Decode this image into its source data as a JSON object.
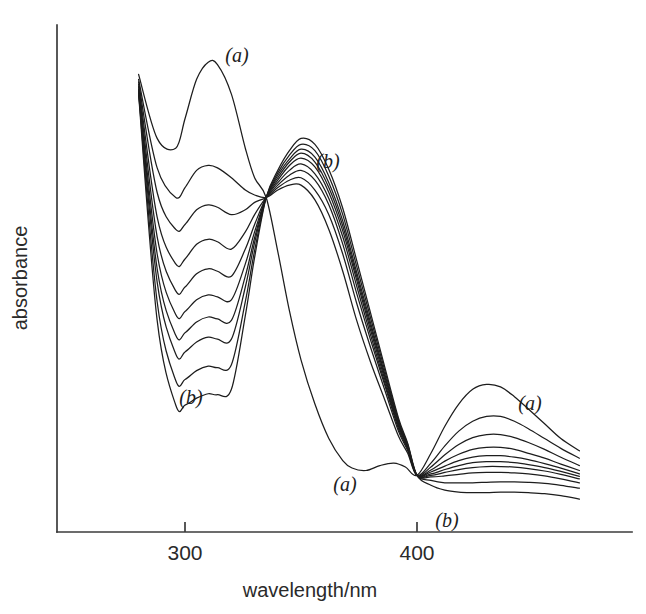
{
  "figure": {
    "kind": "uv-vis-absorption-spectra",
    "background_color": "#ffffff",
    "line_color": "#1d1d1d",
    "axis_color": "#3b3b3b"
  },
  "axes": {
    "x_title": "wavelength/nm",
    "y_title": "absorbance",
    "x_ticks": [
      {
        "label": "300",
        "value": 300
      },
      {
        "label": "400",
        "value": 400
      }
    ],
    "y_ticks": []
  },
  "labels": {
    "top_left_a": "(a)",
    "top_mid_b": "(b)",
    "lower_left_b": "(b)",
    "lower_mid_a": "(a)",
    "right_a": "(a)",
    "right_b": "(b)"
  },
  "chart_data": {
    "type": "line",
    "title": "",
    "xlabel": "wavelength/nm",
    "ylabel": "absorbance",
    "xlim": [
      270,
      472
    ],
    "ylim": [
      0,
      1.0
    ],
    "grid": false,
    "legend": "none",
    "n_series": 10,
    "series_direction": "(a) to (b) — decreasing UV band at 310 nm and visible band at 430 nm, increasing band at 350 nm",
    "isosbestic_points": [
      {
        "wavelength": 335,
        "absorbance": 0.68
      },
      {
        "wavelength": 400,
        "absorbance": 0.115
      }
    ],
    "annotations": [
      {
        "text": "(a)",
        "wavelength": 322,
        "absorbance": 0.955,
        "note": "first spectrum, 310 nm band maximum"
      },
      {
        "text": "(b)",
        "wavelength": 361,
        "absorbance": 0.715,
        "note": "last spectrum, 350 nm band maximum"
      },
      {
        "text": "(b)",
        "wavelength": 304,
        "absorbance": 0.265,
        "note": "last spectrum, UV band minimum"
      },
      {
        "text": "(a)",
        "wavelength": 371,
        "absorbance": 0.095,
        "note": "first spectrum, valley before visible band"
      },
      {
        "text": "(a)",
        "wavelength": 450,
        "absorbance": 0.255,
        "note": "first spectrum, visible band"
      },
      {
        "text": "(b)",
        "wavelength": 414,
        "absorbance": 0.025,
        "note": "last spectrum, visible band"
      }
    ],
    "series": [
      {
        "name": "(a)",
        "index": 0,
        "x": [
          280,
          288,
          296,
          300,
          305,
          310,
          314,
          320,
          326,
          330,
          335,
          340,
          345,
          350,
          356,
          362,
          368,
          372,
          378,
          384,
          390,
          395,
          400,
          406,
          412,
          418,
          424,
          430,
          436,
          442,
          448,
          455,
          462,
          470
        ],
        "y": [
          0.93,
          0.8,
          0.78,
          0.84,
          0.92,
          0.955,
          0.95,
          0.89,
          0.78,
          0.72,
          0.68,
          0.57,
          0.45,
          0.35,
          0.26,
          0.19,
          0.145,
          0.13,
          0.125,
          0.135,
          0.14,
          0.132,
          0.115,
          0.16,
          0.215,
          0.26,
          0.29,
          0.3,
          0.295,
          0.275,
          0.25,
          0.22,
          0.19,
          0.165
        ]
      },
      {
        "name": "2",
        "index": 1,
        "x": [
          280,
          288,
          296,
          300,
          305,
          310,
          314,
          320,
          326,
          330,
          335,
          340,
          345,
          350,
          356,
          362,
          368,
          374,
          380,
          386,
          392,
          396,
          400,
          406,
          412,
          418,
          424,
          430,
          436,
          442,
          448,
          455,
          462,
          470
        ],
        "y": [
          0.92,
          0.74,
          0.68,
          0.7,
          0.735,
          0.745,
          0.74,
          0.72,
          0.695,
          0.685,
          0.68,
          0.695,
          0.705,
          0.705,
          0.675,
          0.615,
          0.53,
          0.43,
          0.345,
          0.27,
          0.195,
          0.16,
          0.115,
          0.14,
          0.175,
          0.205,
          0.225,
          0.235,
          0.235,
          0.225,
          0.21,
          0.19,
          0.17,
          0.15
        ]
      },
      {
        "name": "3",
        "index": 2,
        "x": [
          280,
          288,
          296,
          300,
          305,
          310,
          314,
          320,
          326,
          330,
          335,
          340,
          345,
          350,
          356,
          362,
          368,
          374,
          380,
          386,
          392,
          396,
          400,
          406,
          412,
          418,
          424,
          430,
          436,
          442,
          448,
          455,
          462,
          470
        ],
        "y": [
          0.915,
          0.69,
          0.615,
          0.625,
          0.655,
          0.665,
          0.66,
          0.645,
          0.655,
          0.67,
          0.68,
          0.7,
          0.715,
          0.72,
          0.695,
          0.645,
          0.565,
          0.465,
          0.375,
          0.29,
          0.205,
          0.165,
          0.115,
          0.132,
          0.157,
          0.178,
          0.192,
          0.198,
          0.198,
          0.192,
          0.182,
          0.168,
          0.152,
          0.135
        ]
      },
      {
        "name": "4",
        "index": 3,
        "x": [
          280,
          288,
          296,
          300,
          305,
          310,
          314,
          320,
          326,
          330,
          335,
          340,
          345,
          350,
          356,
          362,
          368,
          374,
          380,
          386,
          392,
          396,
          400,
          406,
          412,
          418,
          424,
          430,
          436,
          442,
          448,
          455,
          462,
          470
        ],
        "y": [
          0.91,
          0.64,
          0.545,
          0.555,
          0.585,
          0.595,
          0.59,
          0.575,
          0.61,
          0.645,
          0.68,
          0.705,
          0.725,
          0.735,
          0.715,
          0.665,
          0.585,
          0.485,
          0.39,
          0.3,
          0.21,
          0.168,
          0.115,
          0.126,
          0.144,
          0.158,
          0.168,
          0.172,
          0.172,
          0.168,
          0.16,
          0.15,
          0.138,
          0.125
        ]
      },
      {
        "name": "5",
        "index": 4,
        "x": [
          280,
          288,
          296,
          300,
          305,
          310,
          314,
          320,
          326,
          330,
          335,
          340,
          345,
          350,
          356,
          362,
          368,
          374,
          380,
          386,
          392,
          396,
          400,
          406,
          412,
          418,
          424,
          430,
          436,
          442,
          448,
          455,
          462,
          470
        ],
        "y": [
          0.905,
          0.6,
          0.49,
          0.498,
          0.525,
          0.535,
          0.53,
          0.52,
          0.575,
          0.625,
          0.68,
          0.71,
          0.735,
          0.748,
          0.728,
          0.678,
          0.6,
          0.5,
          0.4,
          0.305,
          0.215,
          0.17,
          0.115,
          0.122,
          0.134,
          0.145,
          0.152,
          0.155,
          0.155,
          0.152,
          0.147,
          0.139,
          0.13,
          0.118
        ]
      },
      {
        "name": "6",
        "index": 5,
        "x": [
          280,
          288,
          296,
          300,
          305,
          310,
          314,
          320,
          326,
          330,
          335,
          340,
          345,
          350,
          356,
          362,
          368,
          374,
          380,
          386,
          392,
          396,
          400,
          406,
          412,
          418,
          424,
          430,
          436,
          442,
          448,
          455,
          462,
          470
        ],
        "y": [
          0.9,
          0.565,
          0.442,
          0.448,
          0.472,
          0.482,
          0.478,
          0.472,
          0.545,
          0.61,
          0.68,
          0.715,
          0.745,
          0.76,
          0.742,
          0.69,
          0.612,
          0.512,
          0.41,
          0.312,
          0.218,
          0.172,
          0.115,
          0.118,
          0.127,
          0.135,
          0.141,
          0.143,
          0.143,
          0.141,
          0.137,
          0.131,
          0.123,
          0.113
        ]
      },
      {
        "name": "7",
        "index": 6,
        "x": [
          280,
          288,
          296,
          300,
          305,
          310,
          314,
          320,
          326,
          330,
          335,
          340,
          345,
          350,
          356,
          362,
          368,
          374,
          380,
          386,
          392,
          396,
          400,
          406,
          412,
          418,
          424,
          430,
          436,
          442,
          448,
          455,
          462,
          470
        ],
        "y": [
          0.898,
          0.535,
          0.4,
          0.405,
          0.427,
          0.437,
          0.433,
          0.43,
          0.52,
          0.598,
          0.68,
          0.72,
          0.752,
          0.77,
          0.752,
          0.7,
          0.622,
          0.52,
          0.418,
          0.318,
          0.222,
          0.174,
          0.115,
          0.115,
          0.121,
          0.127,
          0.131,
          0.133,
          0.133,
          0.132,
          0.129,
          0.124,
          0.117,
          0.108
        ]
      },
      {
        "name": "8",
        "index": 7,
        "x": [
          280,
          288,
          296,
          300,
          305,
          310,
          314,
          320,
          326,
          330,
          335,
          340,
          345,
          350,
          356,
          362,
          368,
          374,
          380,
          386,
          392,
          396,
          400,
          406,
          412,
          418,
          424,
          430,
          436,
          442,
          448,
          455,
          462,
          470
        ],
        "y": [
          0.895,
          0.508,
          0.362,
          0.366,
          0.386,
          0.396,
          0.392,
          0.392,
          0.498,
          0.588,
          0.68,
          0.725,
          0.758,
          0.778,
          0.762,
          0.71,
          0.632,
          0.528,
          0.425,
          0.323,
          0.225,
          0.176,
          0.115,
          0.112,
          0.114,
          0.117,
          0.12,
          0.121,
          0.121,
          0.12,
          0.118,
          0.114,
          0.108,
          0.1
        ]
      },
      {
        "name": "9",
        "index": 8,
        "x": [
          280,
          288,
          296,
          300,
          305,
          310,
          314,
          320,
          326,
          330,
          335,
          340,
          345,
          350,
          356,
          362,
          368,
          374,
          380,
          386,
          392,
          396,
          400,
          406,
          412,
          418,
          424,
          430,
          436,
          442,
          448,
          455,
          462,
          470
        ],
        "y": [
          0.893,
          0.468,
          0.308,
          0.31,
          0.328,
          0.337,
          0.334,
          0.34,
          0.468,
          0.572,
          0.68,
          0.73,
          0.766,
          0.788,
          0.775,
          0.723,
          0.645,
          0.54,
          0.435,
          0.33,
          0.228,
          0.178,
          0.115,
          0.105,
          0.1,
          0.1,
          0.1,
          0.101,
          0.102,
          0.102,
          0.101,
          0.099,
          0.095,
          0.089
        ]
      },
      {
        "name": "(b)",
        "index": 9,
        "x": [
          280,
          288,
          296,
          300,
          305,
          310,
          314,
          320,
          326,
          330,
          335,
          340,
          345,
          350,
          356,
          362,
          368,
          374,
          380,
          386,
          392,
          396,
          400,
          406,
          412,
          418,
          424,
          430,
          436,
          442,
          448,
          455,
          462,
          470
        ],
        "y": [
          0.89,
          0.43,
          0.258,
          0.258,
          0.272,
          0.281,
          0.279,
          0.29,
          0.44,
          0.558,
          0.68,
          0.735,
          0.775,
          0.8,
          0.788,
          0.737,
          0.658,
          0.552,
          0.445,
          0.337,
          0.232,
          0.18,
          0.115,
          0.095,
          0.085,
          0.081,
          0.08,
          0.08,
          0.081,
          0.081,
          0.08,
          0.078,
          0.074,
          0.067
        ]
      }
    ]
  }
}
